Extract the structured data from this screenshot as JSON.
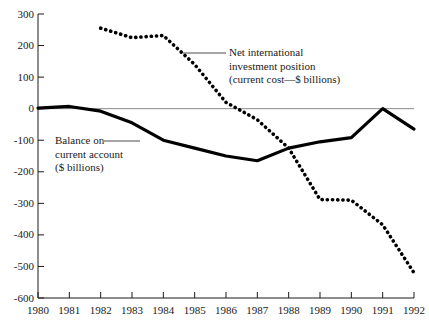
{
  "chart_data": {
    "type": "line",
    "title": "",
    "xlabel": "",
    "ylabel": "",
    "grid": false,
    "legend_position": "inline-annotations",
    "x": [
      1980,
      1981,
      1982,
      1983,
      1984,
      1985,
      1986,
      1987,
      1988,
      1989,
      1990,
      1991,
      1992
    ],
    "categories": [
      "1980",
      "1981",
      "1982",
      "1983",
      "1984",
      "1985",
      "1986",
      "1987",
      "1988",
      "1989",
      "1990",
      "1991",
      "1992"
    ],
    "xlim": [
      1980,
      1992
    ],
    "ylim": [
      -600,
      300
    ],
    "yticks": [
      300,
      200,
      100,
      0,
      -100,
      -200,
      -300,
      -400,
      -500,
      -600
    ],
    "ytick_labels": [
      "300",
      "200",
      "100",
      "0",
      "-100",
      "-200",
      "-300",
      "-400",
      "-500",
      "-600"
    ],
    "xtick_labels": [
      "1980",
      "1981",
      "1982",
      "1983",
      "1984",
      "1985",
      "1986",
      "1987",
      "1988",
      "1989",
      "1990",
      "1991",
      "1992"
    ],
    "zero_line": 0,
    "series": [
      {
        "name": "Balance on current account ($ billions)",
        "style": "solid",
        "color": "#000000",
        "x": [
          1980,
          1981,
          1982,
          1983,
          1984,
          1985,
          1986,
          1987,
          1988,
          1989,
          1990,
          1991,
          1992
        ],
        "values": [
          2,
          7,
          -8,
          -45,
          -100,
          -125,
          -150,
          -165,
          -125,
          -105,
          -92,
          0,
          -65
        ]
      },
      {
        "name": "Net international investment position (current cost—$ billions)",
        "style": "dotted",
        "color": "#000000",
        "x": [
          1982,
          1983,
          1984,
          1985,
          1986,
          1987,
          1988,
          1989,
          1990,
          1991,
          1992
        ],
        "values": [
          255,
          225,
          232,
          140,
          20,
          -35,
          -125,
          -288,
          -290,
          -368,
          -520
        ]
      }
    ],
    "annotations": [
      {
        "id": "niip",
        "lines": [
          "Net international",
          "investment position",
          "(current cost—$ billions)"
        ],
        "leader": true
      },
      {
        "id": "bca",
        "lines": [
          "Balance on",
          "current account",
          "($ billions)"
        ],
        "leader": true
      }
    ]
  },
  "strips": {
    "top_faint": "",
    "bottom_faint": ""
  }
}
